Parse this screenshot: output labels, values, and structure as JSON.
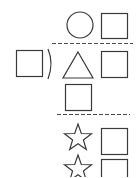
{
  "worksheet": {
    "description": "Shape sequence puzzle",
    "colors": {
      "stroke": "#3a3a3a",
      "background": "#ffffff"
    },
    "rows": [
      {
        "shapes": [
          "circle",
          "square"
        ]
      },
      {
        "separator": "dashed-line"
      },
      {
        "shapes": [
          "square",
          "parenthesis",
          "triangle",
          "square"
        ]
      },
      {
        "shapes": [
          "square"
        ]
      },
      {
        "separator": "dashed-line"
      },
      {
        "shapes": [
          "star",
          "square"
        ]
      },
      {
        "shapes": [
          "star",
          "square"
        ]
      }
    ]
  }
}
